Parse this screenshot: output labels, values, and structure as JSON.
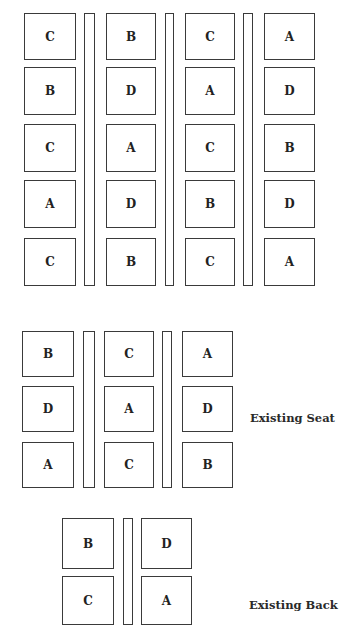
{
  "diagrams": [
    {
      "name": "top-grid",
      "label": "",
      "rows": [
        [
          "C",
          "B",
          "C",
          "A"
        ],
        [
          "B",
          "D",
          "A",
          "D"
        ],
        [
          "C",
          "A",
          "C",
          "B"
        ],
        [
          "A",
          "D",
          "B",
          "D"
        ],
        [
          "C",
          "B",
          "C",
          "A"
        ]
      ]
    },
    {
      "name": "existing-seat-grid",
      "label": "Existing Seat",
      "rows": [
        [
          "B",
          "C",
          "A"
        ],
        [
          "D",
          "A",
          "D"
        ],
        [
          "A",
          "C",
          "B"
        ]
      ]
    },
    {
      "name": "existing-back-grid",
      "label": "Existing Back",
      "rows": [
        [
          "B",
          "D"
        ],
        [
          "C",
          "A"
        ]
      ]
    }
  ]
}
